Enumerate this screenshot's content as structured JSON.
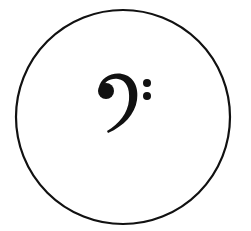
{
  "figure": {
    "symbol": "bass-clef",
    "symbol_label": "Bass clef (F clef)",
    "container_shape": "circle",
    "colors": {
      "stroke": "#111111",
      "fill": "#111111",
      "background": "#ffffff"
    }
  }
}
